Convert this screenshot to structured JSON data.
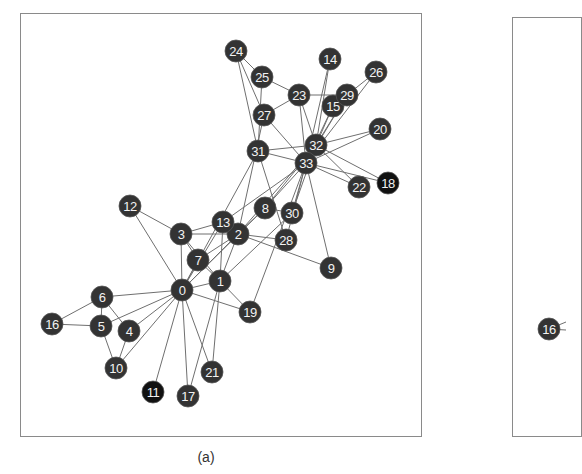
{
  "figure": {
    "panel_a_caption": "(a)",
    "colors": {
      "node_fill": "#333333",
      "node_fill_dark": "#111111",
      "edge": "#6f6f6f",
      "frame": "#8a8a8a",
      "label": "#f2f2f2"
    }
  },
  "panel_a": {
    "nodes": [
      {
        "id": 0,
        "label": "0",
        "x": 182,
        "y": 290
      },
      {
        "id": 1,
        "label": "1",
        "x": 220,
        "y": 281
      },
      {
        "id": 2,
        "label": "2",
        "x": 238,
        "y": 234
      },
      {
        "id": 3,
        "label": "3",
        "x": 181,
        "y": 234
      },
      {
        "id": 4,
        "label": "4",
        "x": 129,
        "y": 331
      },
      {
        "id": 5,
        "label": "5",
        "x": 101,
        "y": 326
      },
      {
        "id": 6,
        "label": "6",
        "x": 102,
        "y": 297
      },
      {
        "id": 7,
        "label": "7",
        "x": 198,
        "y": 260
      },
      {
        "id": 8,
        "label": "8",
        "x": 265,
        "y": 208
      },
      {
        "id": 9,
        "label": "9",
        "x": 331,
        "y": 268
      },
      {
        "id": 10,
        "label": "10",
        "x": 116,
        "y": 368
      },
      {
        "id": 11,
        "label": "11",
        "x": 153,
        "y": 392,
        "dark": true
      },
      {
        "id": 12,
        "label": "12",
        "x": 130,
        "y": 206
      },
      {
        "id": 13,
        "label": "13",
        "x": 223,
        "y": 222
      },
      {
        "id": 14,
        "label": "14",
        "x": 330,
        "y": 59
      },
      {
        "id": 15,
        "label": "15",
        "x": 333,
        "y": 106
      },
      {
        "id": 16,
        "label": "16",
        "x": 52,
        "y": 324
      },
      {
        "id": 17,
        "label": "17",
        "x": 188,
        "y": 396
      },
      {
        "id": 18,
        "label": "18",
        "x": 388,
        "y": 183,
        "dark": true
      },
      {
        "id": 19,
        "label": "19",
        "x": 250,
        "y": 312
      },
      {
        "id": 20,
        "label": "20",
        "x": 380,
        "y": 129
      },
      {
        "id": 21,
        "label": "21",
        "x": 212,
        "y": 372
      },
      {
        "id": 22,
        "label": "22",
        "x": 359,
        "y": 187
      },
      {
        "id": 23,
        "label": "23",
        "x": 299,
        "y": 95
      },
      {
        "id": 24,
        "label": "24",
        "x": 236,
        "y": 51
      },
      {
        "id": 25,
        "label": "25",
        "x": 262,
        "y": 77
      },
      {
        "id": 26,
        "label": "26",
        "x": 376,
        "y": 72
      },
      {
        "id": 27,
        "label": "27",
        "x": 264,
        "y": 115
      },
      {
        "id": 28,
        "label": "28",
        "x": 286,
        "y": 240
      },
      {
        "id": 29,
        "label": "29",
        "x": 347,
        "y": 95
      },
      {
        "id": 30,
        "label": "30",
        "x": 292,
        "y": 213
      },
      {
        "id": 31,
        "label": "31",
        "x": 258,
        "y": 151
      },
      {
        "id": 32,
        "label": "32",
        "x": 316,
        "y": 145
      },
      {
        "id": 33,
        "label": "33",
        "x": 306,
        "y": 163
      }
    ],
    "edges": [
      [
        0,
        1
      ],
      [
        0,
        2
      ],
      [
        0,
        3
      ],
      [
        0,
        4
      ],
      [
        0,
        5
      ],
      [
        0,
        6
      ],
      [
        0,
        7
      ],
      [
        0,
        8
      ],
      [
        0,
        10
      ],
      [
        0,
        11
      ],
      [
        0,
        12
      ],
      [
        0,
        13
      ],
      [
        0,
        17
      ],
      [
        0,
        19
      ],
      [
        0,
        21
      ],
      [
        0,
        31
      ],
      [
        1,
        2
      ],
      [
        1,
        3
      ],
      [
        1,
        7
      ],
      [
        1,
        13
      ],
      [
        1,
        17
      ],
      [
        1,
        19
      ],
      [
        1,
        21
      ],
      [
        1,
        30
      ],
      [
        2,
        3
      ],
      [
        2,
        7
      ],
      [
        2,
        8
      ],
      [
        2,
        9
      ],
      [
        2,
        13
      ],
      [
        2,
        27
      ],
      [
        2,
        28
      ],
      [
        2,
        32
      ],
      [
        3,
        7
      ],
      [
        3,
        12
      ],
      [
        3,
        13
      ],
      [
        4,
        6
      ],
      [
        4,
        10
      ],
      [
        5,
        6
      ],
      [
        5,
        10
      ],
      [
        5,
        16
      ],
      [
        6,
        16
      ],
      [
        8,
        30
      ],
      [
        8,
        32
      ],
      [
        8,
        33
      ],
      [
        9,
        33
      ],
      [
        13,
        33
      ],
      [
        14,
        32
      ],
      [
        14,
        33
      ],
      [
        15,
        32
      ],
      [
        15,
        33
      ],
      [
        18,
        32
      ],
      [
        18,
        33
      ],
      [
        19,
        33
      ],
      [
        20,
        32
      ],
      [
        20,
        33
      ],
      [
        22,
        32
      ],
      [
        22,
        33
      ],
      [
        23,
        25
      ],
      [
        23,
        27
      ],
      [
        23,
        29
      ],
      [
        23,
        32
      ],
      [
        23,
        33
      ],
      [
        24,
        25
      ],
      [
        24,
        27
      ],
      [
        24,
        31
      ],
      [
        25,
        31
      ],
      [
        26,
        29
      ],
      [
        26,
        33
      ],
      [
        27,
        33
      ],
      [
        28,
        31
      ],
      [
        28,
        33
      ],
      [
        29,
        32
      ],
      [
        29,
        33
      ],
      [
        30,
        32
      ],
      [
        30,
        33
      ],
      [
        31,
        32
      ],
      [
        31,
        33
      ],
      [
        32,
        33
      ]
    ]
  },
  "panel_b": {
    "visible_nodes": [
      {
        "id": 16,
        "label": "16",
        "x": 549,
        "y": 329
      }
    ],
    "visible_edge_stubs": [
      {
        "from": 16,
        "to_x": 566,
        "to_y": 322
      },
      {
        "from": 16,
        "to_x": 566,
        "to_y": 330
      }
    ]
  }
}
